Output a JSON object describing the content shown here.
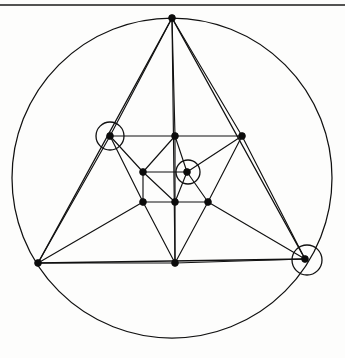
{
  "figure": {
    "type": "geometry-diagram",
    "canvas": {
      "width": 345,
      "height": 358
    },
    "colors": {
      "ink": "#111111",
      "vertex": "#0c0c0c",
      "background": "#fdfdfc",
      "marker": "#111111"
    },
    "page_rule": {
      "label": "page-border-rule",
      "x1": 0,
      "y1": 5,
      "x2": 345,
      "y2": 5
    },
    "circumcircle": {
      "label": "circumscribed-circle",
      "cx": 172,
      "cy": 178,
      "r": 160
    },
    "vertices": [
      {
        "id": "A",
        "label": "top-apex",
        "x": 172,
        "y": 18,
        "marked": false
      },
      {
        "id": "B",
        "label": "bottom-left-vertex",
        "x": 38,
        "y": 263,
        "marked": false
      },
      {
        "id": "C",
        "label": "right-vertex",
        "x": 305,
        "y": 259,
        "marked": true
      },
      {
        "id": "D",
        "label": "upper-left-node",
        "x": 110,
        "y": 136,
        "marked": true
      },
      {
        "id": "E",
        "label": "upper-mid-node",
        "x": 175,
        "y": 136,
        "marked": false
      },
      {
        "id": "F",
        "label": "upper-right-node",
        "x": 242,
        "y": 136,
        "marked": false
      },
      {
        "id": "G",
        "label": "center-left-node",
        "x": 143,
        "y": 172,
        "marked": false
      },
      {
        "id": "H",
        "label": "center-node",
        "x": 187,
        "y": 172,
        "marked": true
      },
      {
        "id": "I",
        "label": "lower-left-node",
        "x": 143,
        "y": 202,
        "marked": false
      },
      {
        "id": "J",
        "label": "lower-mid-node",
        "x": 175,
        "y": 202,
        "marked": false
      },
      {
        "id": "K",
        "label": "lower-right-node",
        "x": 208,
        "y": 202,
        "marked": false
      },
      {
        "id": "L",
        "label": "bottom-mid-vertex",
        "x": 175,
        "y": 263,
        "marked": false
      }
    ],
    "marker_circles": [
      {
        "label": "highlight-upper-left",
        "cx": 110,
        "cy": 136,
        "r": 14
      },
      {
        "label": "highlight-center",
        "cx": 188,
        "cy": 172,
        "r": 12
      },
      {
        "label": "highlight-right",
        "cx": 307,
        "cy": 260,
        "r": 15
      }
    ],
    "edges": [
      {
        "from": "A",
        "to": "B",
        "role": "outer-triangle"
      },
      {
        "from": "B",
        "to": "C",
        "role": "outer-triangle"
      },
      {
        "from": "C",
        "to": "A",
        "role": "outer-triangle"
      },
      {
        "from": "A",
        "to": "D",
        "role": "apex-to-inner"
      },
      {
        "from": "A",
        "to": "E",
        "role": "apex-to-inner"
      },
      {
        "from": "A",
        "to": "F",
        "role": "apex-to-inner"
      },
      {
        "from": "B",
        "to": "D",
        "role": "corner-to-inner"
      },
      {
        "from": "B",
        "to": "I",
        "role": "corner-to-inner"
      },
      {
        "from": "B",
        "to": "L",
        "role": "corner-to-inner"
      },
      {
        "from": "C",
        "to": "F",
        "role": "corner-to-inner"
      },
      {
        "from": "C",
        "to": "K",
        "role": "corner-to-inner"
      },
      {
        "from": "C",
        "to": "L",
        "role": "corner-to-inner"
      },
      {
        "from": "D",
        "to": "E",
        "role": "inner-top-row"
      },
      {
        "from": "E",
        "to": "F",
        "role": "inner-top-row"
      },
      {
        "from": "D",
        "to": "G",
        "role": "inner-mesh"
      },
      {
        "from": "D",
        "to": "I",
        "role": "inner-mesh"
      },
      {
        "from": "F",
        "to": "H",
        "role": "inner-mesh"
      },
      {
        "from": "F",
        "to": "K",
        "role": "inner-mesh"
      },
      {
        "from": "E",
        "to": "G",
        "role": "inner-mesh"
      },
      {
        "from": "E",
        "to": "H",
        "role": "inner-mesh"
      },
      {
        "from": "G",
        "to": "H",
        "role": "inner-mid-row"
      },
      {
        "from": "G",
        "to": "I",
        "role": "inner-mesh"
      },
      {
        "from": "G",
        "to": "J",
        "role": "inner-mesh"
      },
      {
        "from": "H",
        "to": "J",
        "role": "inner-mesh"
      },
      {
        "from": "H",
        "to": "K",
        "role": "inner-mesh"
      },
      {
        "from": "I",
        "to": "J",
        "role": "inner-bottom-row"
      },
      {
        "from": "J",
        "to": "K",
        "role": "inner-bottom-row"
      },
      {
        "from": "I",
        "to": "L",
        "role": "inner-to-bottom"
      },
      {
        "from": "J",
        "to": "L",
        "role": "inner-to-bottom"
      },
      {
        "from": "K",
        "to": "L",
        "role": "inner-to-bottom"
      },
      {
        "from": "E",
        "to": "J",
        "role": "vertical-median"
      },
      {
        "from": "A",
        "to": "L",
        "role": "vertical-median-upper"
      }
    ]
  }
}
